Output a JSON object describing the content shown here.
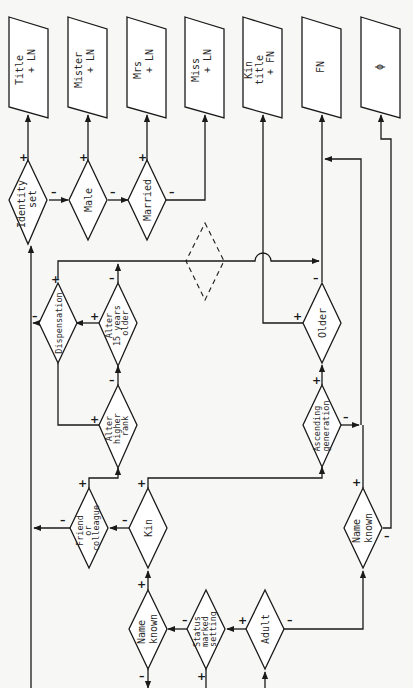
{
  "diagram": {
    "outputs": [
      {
        "id": "title-ln",
        "lines": [
          "Title",
          "+ LN"
        ]
      },
      {
        "id": "mister-ln",
        "lines": [
          "Mister",
          "+ LN"
        ]
      },
      {
        "id": "mrs-ln",
        "lines": [
          "Mrs",
          "+ LN"
        ]
      },
      {
        "id": "miss-ln",
        "lines": [
          "Miss",
          "+ LN"
        ]
      },
      {
        "id": "kin-title-fn",
        "lines": [
          "Kin",
          "title",
          "+ FN"
        ]
      },
      {
        "id": "fn",
        "lines": [
          "FN"
        ]
      },
      {
        "id": "null",
        "lines": [
          "ϕ"
        ]
      }
    ],
    "decisions": {
      "identity_set": [
        "Identity",
        "set"
      ],
      "male": [
        "Male"
      ],
      "married": [
        "Married"
      ],
      "dispensation": [
        "Dispensation"
      ],
      "alter_15_older": [
        "Alter",
        "15 years",
        "older"
      ],
      "alter_higher_rank": [
        "Alter",
        "higher",
        "rank"
      ],
      "older": [
        "Older"
      ],
      "ascending_generation": [
        "Ascending",
        "generation"
      ],
      "friend_colleague": [
        "Friend",
        "or",
        "colleague"
      ],
      "kin": [
        "Kin"
      ],
      "name_known_right": [
        "Name",
        "known"
      ],
      "name_known": [
        "Name",
        "known"
      ],
      "status_marked_setting": [
        "Status",
        "marked",
        "setting"
      ],
      "adult": [
        "Adult"
      ]
    },
    "signs": {
      "plus": "+",
      "minus": "–"
    }
  }
}
